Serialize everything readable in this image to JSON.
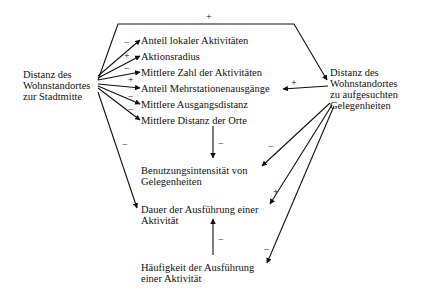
{
  "diagram": {
    "nodes": {
      "dist_center": "Distanz des\nWohnstandortes\nzur Stadtmitte",
      "dist_opps": "Distanz des\nWohnstandortes\nzu aufgesuchten\nGelegenheiten",
      "list": [
        "Anteil lokaler Aktivitäten",
        "Aktionsradius",
        "Mittlere Zahl der Aktivitäten",
        "Anteil Mehrstationenausgänge",
        "Mittlere Ausgangsdistanz",
        "Mittlere Distanz der Orte"
      ],
      "usage": "Benutzungsintensität von\nGelegenheiten",
      "duration": "Dauer der Ausführung einer\nAktivität",
      "frequency": "Häufigkeit der Ausführung\neiner Aktivität"
    },
    "edges": [
      {
        "from": "dist_center",
        "to": "dist_opps",
        "sign": "+"
      },
      {
        "from": "dist_center",
        "to": "list.0",
        "sign": "−"
      },
      {
        "from": "dist_center",
        "to": "list.1",
        "sign": "+"
      },
      {
        "from": "dist_center",
        "to": "list.2",
        "sign": "−"
      },
      {
        "from": "dist_center",
        "to": "list.3",
        "sign": "+"
      },
      {
        "from": "dist_center",
        "to": "list.4",
        "sign": "−"
      },
      {
        "from": "dist_center",
        "to": "list.5",
        "sign": "−"
      },
      {
        "from": "dist_opps",
        "to": "list.3",
        "sign": "+"
      },
      {
        "from": "list",
        "to": "usage",
        "sign": "−"
      },
      {
        "from": "dist_center",
        "to": "duration",
        "sign": "−"
      },
      {
        "from": "dist_opps",
        "to": "usage",
        "sign": "−"
      },
      {
        "from": "dist_opps",
        "to": "duration",
        "sign": "+"
      },
      {
        "from": "dist_opps",
        "to": "frequency",
        "sign": "−"
      },
      {
        "from": "frequency",
        "to": "duration",
        "sign": "−"
      }
    ]
  }
}
